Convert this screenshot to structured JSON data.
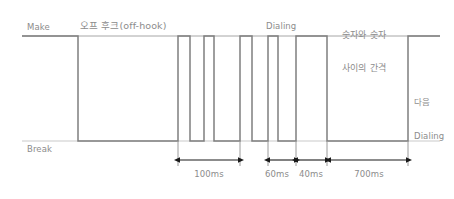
{
  "diagram": {
    "title_alt": "Pulse dialing timing diagram",
    "levels": {
      "make_label": "Make",
      "break_label": "Break"
    },
    "annotations": {
      "off_hook": "오프 후크(off-hook)",
      "dialing": "Dialing",
      "digit_gap_line1": "숫자와 숫자",
      "digit_gap_line2": "사이의 간격",
      "next_dialing_line1": "다음",
      "next_dialing_line2": "Dialing"
    },
    "measurements": [
      {
        "label": "100ms",
        "value": 100,
        "unit": "ms",
        "from_x": 178,
        "to_x": 240
      },
      {
        "label": "60ms",
        "value": 60,
        "unit": "ms",
        "from_x": 268,
        "to_x": 296
      },
      {
        "label": "40ms",
        "value": 40,
        "unit": "ms",
        "from_x": 296,
        "to_x": 327
      },
      {
        "label": "700ms",
        "value": 700,
        "unit": "ms",
        "from_x": 330,
        "to_x": 408
      }
    ],
    "colors": {
      "line": "#808080",
      "baseline": "#9a9a9a",
      "text": "#8c8c8c",
      "arrow": "#1a1a1a",
      "background": "#ffffff"
    },
    "waveform": {
      "make_y": 36,
      "break_y": 141,
      "segments": [
        {
          "state": "make",
          "from_x": 22,
          "to_x": 78
        },
        {
          "state": "break",
          "from_x": 78,
          "to_x": 178
        },
        {
          "state": "make",
          "from_x": 178,
          "to_x": 190
        },
        {
          "state": "break",
          "from_x": 190,
          "to_x": 204
        },
        {
          "state": "make",
          "from_x": 204,
          "to_x": 214
        },
        {
          "state": "break",
          "from_x": 214,
          "to_x": 240
        },
        {
          "state": "make",
          "from_x": 240,
          "to_x": 252
        },
        {
          "state": "break",
          "from_x": 252,
          "to_x": 268
        },
        {
          "state": "make",
          "from_x": 268,
          "to_x": 278
        },
        {
          "state": "break",
          "from_x": 278,
          "to_x": 296
        },
        {
          "state": "make",
          "from_x": 296,
          "to_x": 327
        },
        {
          "state": "break",
          "from_x": 327,
          "to_x": 408
        },
        {
          "state": "make",
          "from_x": 408,
          "to_x": 440
        }
      ]
    }
  }
}
